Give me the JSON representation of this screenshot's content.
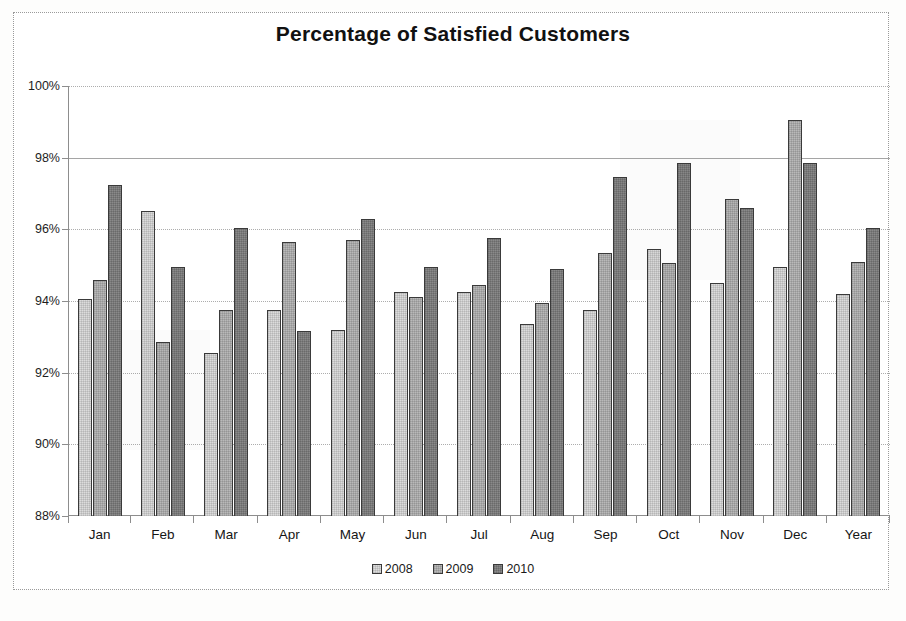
{
  "chart_data": {
    "type": "bar",
    "title": "Percentage of Satisfied Customers",
    "xlabel": "",
    "ylabel": "",
    "ylim": [
      88,
      100
    ],
    "ytick_step": 2,
    "ytick_labels": [
      "100%",
      "98%",
      "96%",
      "94%",
      "92%",
      "90%",
      "88%"
    ],
    "ytick_values": [
      100,
      98,
      96,
      94,
      92,
      90,
      88
    ],
    "grid": true,
    "legend_position": "bottom",
    "categories": [
      "Jan",
      "Feb",
      "Mar",
      "Apr",
      "May",
      "Jun",
      "Jul",
      "Aug",
      "Sep",
      "Oct",
      "Nov",
      "Dec",
      "Year"
    ],
    "series": [
      {
        "name": "2008",
        "color": "#dcdcdc",
        "values": [
          94.05,
          96.5,
          92.55,
          93.75,
          93.2,
          94.25,
          94.25,
          93.35,
          93.75,
          95.45,
          94.5,
          94.95,
          94.2
        ]
      },
      {
        "name": "2009",
        "color": "#b9b9b9",
        "values": [
          94.6,
          92.85,
          93.75,
          95.65,
          95.7,
          94.1,
          94.45,
          93.95,
          95.35,
          95.05,
          96.85,
          99.05,
          95.1
        ]
      },
      {
        "name": "2010",
        "color": "#8a8a8a",
        "values": [
          97.25,
          94.95,
          96.05,
          93.15,
          96.3,
          94.95,
          95.75,
          94.9,
          97.45,
          97.85,
          96.6,
          97.85,
          96.05
        ]
      }
    ]
  },
  "legend": {
    "items": [
      {
        "label": "2008",
        "swatch": "legend-swatch-2008"
      },
      {
        "label": "2009",
        "swatch": "legend-swatch-2009"
      },
      {
        "label": "2010",
        "swatch": "legend-swatch-2010"
      }
    ]
  }
}
